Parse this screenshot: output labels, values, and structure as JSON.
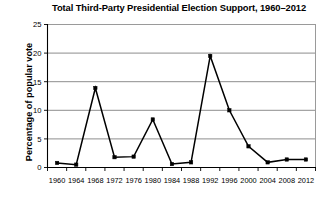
{
  "chart_data": {
    "type": "line",
    "title": "Total Third-Party Presidential Election Support, 1960–2012",
    "xlabel": "",
    "ylabel": "Percentage of popular vote",
    "categories": [
      "1960",
      "1964",
      "1968",
      "1972",
      "1976",
      "1980",
      "1984",
      "1988",
      "1992",
      "1996",
      "2000",
      "2004",
      "2008",
      "2012"
    ],
    "values": [
      0.8,
      0.5,
      13.9,
      1.8,
      1.9,
      8.4,
      0.6,
      0.9,
      19.5,
      10.0,
      3.7,
      0.9,
      1.4,
      1.4
    ],
    "ylim": [
      0,
      25
    ],
    "ytick_labels": [
      "0",
      "5",
      "10",
      "15",
      "20",
      "25"
    ],
    "ytick_values": [
      0,
      5,
      10,
      15,
      20,
      25
    ],
    "grid": true,
    "legend": "none",
    "marker": "square",
    "line_color": "#000000",
    "grid_color": "#808080"
  }
}
